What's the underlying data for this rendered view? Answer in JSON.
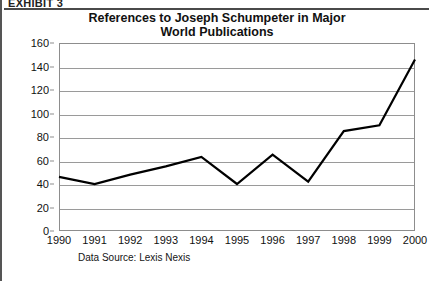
{
  "exhibit": {
    "label": "EXHIBIT 3"
  },
  "chart_data": {
    "type": "line",
    "title": "References to Joseph Schumpeter in Major World Publications",
    "title_line1": "References to Joseph Schumpeter in Major",
    "title_line2": "World Publications",
    "xlabel": "",
    "ylabel": "",
    "categories": [
      "1990",
      "1991",
      "1992",
      "1993",
      "1994",
      "1995",
      "1996",
      "1997",
      "1998",
      "1999",
      "2000"
    ],
    "values": [
      46,
      40,
      48,
      55,
      63,
      40,
      65,
      42,
      85,
      90,
      146
    ],
    "series": [
      {
        "name": "References to Joseph Schumpeter",
        "values": [
          46,
          40,
          48,
          55,
          63,
          40,
          65,
          42,
          85,
          90,
          146
        ]
      }
    ],
    "ylim": [
      0,
      160
    ],
    "ytick_interval": 20,
    "yticks": [
      0,
      20,
      40,
      60,
      80,
      100,
      120,
      140,
      160
    ],
    "ytick_labels": [
      "0",
      "20",
      "40",
      "60",
      "80",
      "100",
      "120",
      "140",
      "160"
    ],
    "grid": "horizontal",
    "legend": "none",
    "line_color": "#000000",
    "plot_border_color": "#8d8d8d",
    "gridline_color": "#9a9a9a"
  },
  "source": {
    "note": "Data Source: Lexis Nexis"
  }
}
